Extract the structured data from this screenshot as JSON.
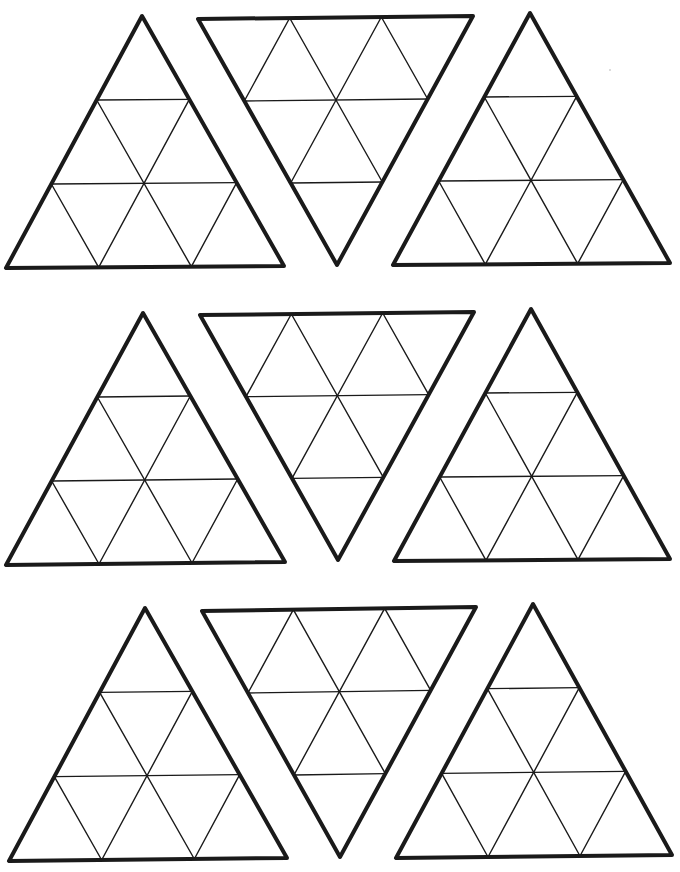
{
  "page": {
    "background": "#ffffff",
    "line_color": "#1a1a1a",
    "subdivisions": 3
  },
  "triangles": [
    {
      "id": "row1-left",
      "orientation": "up",
      "vertices": [
        [
          142,
          16
        ],
        [
          6,
          268
        ],
        [
          284,
          266
        ]
      ]
    },
    {
      "id": "row1-middle",
      "orientation": "down",
      "vertices": [
        [
          198,
          19
        ],
        [
          473,
          16
        ],
        [
          337,
          265
        ]
      ]
    },
    {
      "id": "row1-right",
      "orientation": "up",
      "vertices": [
        [
          530,
          13
        ],
        [
          393,
          265
        ],
        [
          670,
          263
        ]
      ]
    },
    {
      "id": "row2-left",
      "orientation": "up",
      "vertices": [
        [
          143,
          313
        ],
        [
          6,
          565
        ],
        [
          285,
          562
        ]
      ]
    },
    {
      "id": "row2-middle",
      "orientation": "down",
      "vertices": [
        [
          200,
          315
        ],
        [
          474,
          312
        ],
        [
          338,
          560
        ]
      ]
    },
    {
      "id": "row2-right",
      "orientation": "up",
      "vertices": [
        [
          531,
          309
        ],
        [
          394,
          561
        ],
        [
          670,
          559
        ]
      ]
    },
    {
      "id": "row3-left",
      "orientation": "up",
      "vertices": [
        [
          145,
          608
        ],
        [
          9,
          861
        ],
        [
          287,
          858
        ]
      ]
    },
    {
      "id": "row3-middle",
      "orientation": "down",
      "vertices": [
        [
          202,
          611
        ],
        [
          476,
          607
        ],
        [
          340,
          857
        ]
      ]
    },
    {
      "id": "row3-right",
      "orientation": "up",
      "vertices": [
        [
          533,
          604
        ],
        [
          396,
          858
        ],
        [
          672,
          855
        ]
      ]
    }
  ],
  "specks": [
    [
      610,
      70
    ]
  ]
}
